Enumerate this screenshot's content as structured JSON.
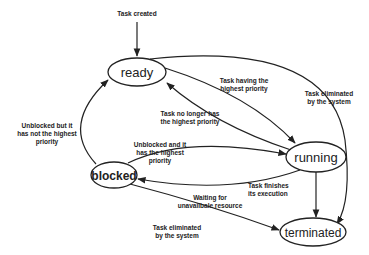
{
  "diagram": {
    "type": "state-transition",
    "colors": {
      "stroke": "#222222",
      "background": "#ffffff"
    },
    "states": {
      "ready": "ready",
      "running": "running",
      "blocked": "blocked",
      "terminated": "terminated"
    },
    "transitions": {
      "created": {
        "line1": "Task created"
      },
      "ready_to_running": {
        "line1": "Task having the",
        "line2": "highest priority"
      },
      "running_to_ready": {
        "line1": "Task no longer has",
        "line2": "the highest priority"
      },
      "ready_to_terminated": {
        "line1": "Task eliminated",
        "line2": "by the system"
      },
      "blocked_to_ready": {
        "line1": "Unblocked but  it",
        "line2": "has not the highest",
        "line3": "priority"
      },
      "blocked_to_running": {
        "line1": "Unblocked and it",
        "line2": "has the highest",
        "line3": "priority"
      },
      "running_to_blocked": {
        "line1": "Waiting for",
        "line2": "unavailbale resource"
      },
      "running_to_terminated": {
        "line1": "Task finishes",
        "line2": "its execution"
      },
      "blocked_to_terminated": {
        "line1": "Task eliminated",
        "line2": "by the system"
      }
    }
  }
}
